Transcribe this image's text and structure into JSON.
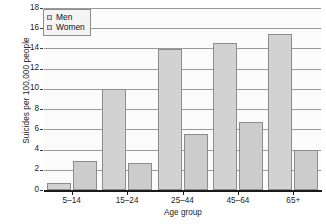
{
  "chart_data": {
    "type": "bar",
    "title": "",
    "xlabel": "Age group",
    "ylabel": "Suicides per 100,000 people",
    "categories": [
      "5–14",
      "15–24",
      "25–44",
      "45–64",
      "65+"
    ],
    "series": [
      {
        "name": "Men",
        "values": [
          0.7,
          10.0,
          13.9,
          14.5,
          15.4
        ]
      },
      {
        "name": "Women",
        "values": [
          2.9,
          2.7,
          5.5,
          6.7,
          4.0
        ]
      }
    ],
    "ylim": [
      0,
      18
    ],
    "yticks": [
      0,
      2,
      4,
      6,
      8,
      10,
      12,
      14,
      16,
      18
    ],
    "ytick_labels": [
      "0",
      "2",
      "4",
      "6",
      "8",
      "10",
      "12",
      "14",
      "16",
      "18"
    ],
    "grid": true,
    "legend_position": "top-left",
    "colors": {
      "men_fill": "#d2d2d2",
      "women_fill": "#cccccc",
      "bar_edge": "#8d8d8d",
      "gridline": "#9a9a9a",
      "axis": "#1a1a1a",
      "plot_background": "#fbfbfb",
      "text": "#1b1b1b"
    }
  },
  "legend": {
    "items": [
      {
        "label": "Men"
      },
      {
        "label": "Women"
      }
    ]
  }
}
